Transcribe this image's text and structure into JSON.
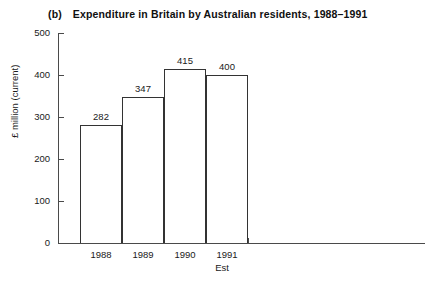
{
  "figure": {
    "panel_label": "(b)",
    "title": "Expenditure in Britain by Australian residents, 1988–1991"
  },
  "chart_data": {
    "type": "bar",
    "panel_label": "(b)",
    "categories": [
      "1988",
      "1989",
      "1990",
      "1991"
    ],
    "values": [
      282,
      347,
      415,
      400
    ],
    "value_labels": [
      "282",
      "347",
      "415",
      "400"
    ],
    "xlabel": "Est",
    "ylabel": "£ million (current)",
    "ylim": [
      0,
      500
    ],
    "yticks": [
      0,
      100,
      200,
      300,
      400,
      500
    ],
    "ytick_labels": [
      "0",
      "100",
      "200",
      "300",
      "400",
      "500"
    ],
    "grid": false,
    "legend": null,
    "bar_fill_color": "#ffffff",
    "bar_edge_color": "#333333",
    "axis_color": "#4a4a4a",
    "background_color": "#ffffff"
  }
}
